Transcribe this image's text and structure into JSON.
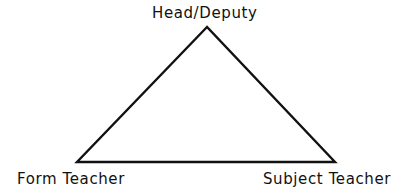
{
  "diagram": {
    "type": "triangle",
    "vertices": {
      "top": {
        "label": "Head/Deputy"
      },
      "bottom_left": {
        "label": "Form Teacher"
      },
      "bottom_right": {
        "label": "Subject Teacher"
      }
    },
    "line_color": "#111111",
    "background": "#ffffff"
  }
}
